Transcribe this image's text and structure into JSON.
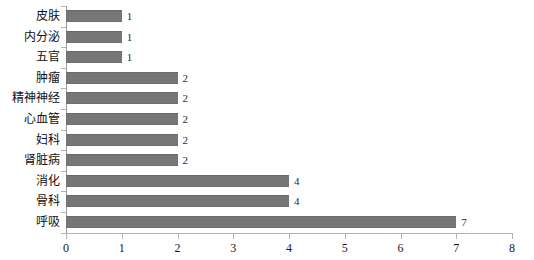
{
  "chart_data": {
    "type": "bar",
    "orientation": "horizontal",
    "title": "",
    "subtitle": "",
    "xlabel": "",
    "ylabel": "",
    "categories": [
      "呼吸",
      "骨科",
      "消化",
      "肾脏病",
      "妇科",
      "心血管",
      "精神神经",
      "肿瘤",
      "五官",
      "内分泌",
      "皮肤"
    ],
    "values": [
      7,
      4,
      4,
      2,
      2,
      2,
      2,
      2,
      1,
      1,
      1
    ],
    "value_labels": [
      "7",
      "4",
      "4",
      "2",
      "2",
      "2",
      "2",
      "2",
      "1",
      "1",
      "1"
    ],
    "xlim": [
      0,
      8
    ],
    "xticks": [
      0,
      1,
      2,
      3,
      4,
      5,
      6,
      7,
      8
    ],
    "xtick_labels": [
      "0",
      "1",
      "2",
      "3",
      "4",
      "5",
      "6",
      "7",
      "8"
    ],
    "grid": false,
    "legend": false,
    "legend_position": "none",
    "bar_color": "#767676",
    "axis_color": "#b4b4b4",
    "text_color": "#1a1a1a",
    "show_value_labels": true
  }
}
